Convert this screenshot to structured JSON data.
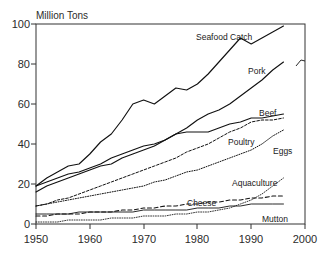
{
  "chart_data": {
    "type": "line",
    "title": "",
    "ylabel": "Million Tons",
    "xlabel": "",
    "xlim": [
      1950,
      2000
    ],
    "ylim": [
      0,
      100
    ],
    "grid": false,
    "legend_position": "inline-annotations",
    "xticks": [
      "1950",
      "1960",
      "1970",
      "1980",
      "1990",
      "2000"
    ],
    "xtick_values": [
      1950,
      1960,
      1970,
      1980,
      1990,
      2000
    ],
    "yticks": [
      "0",
      "20",
      "40",
      "60",
      "80",
      "100"
    ],
    "ytick_values": [
      0,
      20,
      40,
      60,
      80,
      100
    ],
    "x": [
      1950,
      1952,
      1954,
      1956,
      1958,
      1960,
      1962,
      1964,
      1966,
      1968,
      1970,
      1972,
      1974,
      1976,
      1978,
      1980,
      1982,
      1984,
      1986,
      1988,
      1990,
      1992,
      1994,
      1996
    ],
    "series": [
      {
        "name": "Seafood Catch",
        "style": "solid",
        "label": "Seafood Catch",
        "values": [
          19,
          23,
          26,
          29,
          30,
          35,
          41,
          45,
          52,
          60,
          62,
          60,
          64,
          68,
          67,
          70,
          75,
          81,
          87,
          93,
          90,
          93,
          96,
          99
        ]
      },
      {
        "name": "Pork",
        "style": "solid",
        "label": "Pork",
        "values": [
          16,
          19,
          21,
          23,
          25,
          27,
          29,
          30,
          33,
          35,
          37,
          39,
          42,
          45,
          48,
          52,
          55,
          57,
          60,
          64,
          68,
          72,
          77,
          81
        ]
      },
      {
        "name": "Beef",
        "style": "solid",
        "label": "Beef",
        "values": [
          19,
          21,
          23,
          25,
          26,
          28,
          30,
          33,
          35,
          37,
          39,
          40,
          42,
          45,
          46,
          46,
          46,
          48,
          50,
          51,
          53,
          53,
          54,
          55
        ]
      },
      {
        "name": "Poultry",
        "style": "dashed",
        "label": "Poultry",
        "values": [
          9,
          10,
          12,
          13,
          15,
          17,
          19,
          21,
          23,
          25,
          27,
          29,
          31,
          33,
          36,
          38,
          40,
          43,
          46,
          48,
          51,
          52,
          52,
          53
        ]
      },
      {
        "name": "Eggs",
        "style": "dotted",
        "label": "Eggs",
        "values": [
          9,
          10,
          11,
          12,
          13,
          14,
          15,
          16,
          17,
          18,
          19,
          21,
          22,
          24,
          26,
          27,
          29,
          31,
          33,
          35,
          37,
          40,
          44,
          47
        ]
      },
      {
        "name": "Aquaculture",
        "style": "dotted",
        "label": "Aquaculture",
        "values": [
          1,
          1,
          1,
          2,
          2,
          2,
          2,
          3,
          3,
          3,
          4,
          4,
          4,
          5,
          5,
          6,
          6,
          7,
          8,
          10,
          12,
          15,
          19,
          23
        ]
      },
      {
        "name": "Cheese",
        "style": "dashed",
        "label": "Cheese",
        "values": [
          4,
          4,
          5,
          5,
          5,
          6,
          6,
          6,
          7,
          7,
          8,
          8,
          9,
          9,
          10,
          10,
          11,
          11,
          12,
          12,
          13,
          13,
          14,
          14
        ]
      },
      {
        "name": "Mutton",
        "style": "solid",
        "label": "Mutton",
        "values": [
          5,
          5,
          5,
          5,
          6,
          6,
          6,
          6,
          6,
          6,
          7,
          7,
          7,
          7,
          7,
          8,
          8,
          8,
          9,
          9,
          10,
          10,
          10,
          10
        ]
      }
    ]
  },
  "annotations": {
    "seafood_catch": "Seafood Catch",
    "pork": "Pork",
    "beef": "Beef",
    "poultry": "Poultry",
    "eggs": "Eggs",
    "aquaculture": "Aquaculture",
    "cheese": "Cheese",
    "mutton": "Mutton"
  },
  "axes": {
    "y_label": "Million Tons",
    "y_ticks": [
      "100",
      "80",
      "60",
      "40",
      "20",
      "0"
    ],
    "x_ticks": [
      "1950",
      "1960",
      "1970",
      "1980",
      "1990",
      "2000"
    ]
  }
}
